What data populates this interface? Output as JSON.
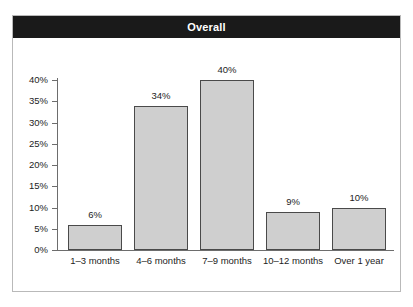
{
  "title": "Overall",
  "colors": {
    "title_band": "#1a1a1a",
    "title_text": "#ffffff",
    "bar_fill": "#cfcfcf",
    "bar_border": "#4a4a4a",
    "axis": "#6d6d6d",
    "frame": "#b9b9b9",
    "background": "#ffffff",
    "text": "#1d1d1d"
  },
  "chart_data": {
    "type": "bar",
    "title": "Overall",
    "xlabel": "",
    "ylabel": "",
    "categories": [
      "1–3 months",
      "4–6 months",
      "7–9 months",
      "10–12 months",
      "Over 1 year"
    ],
    "values": [
      6,
      34,
      40,
      9,
      10
    ],
    "value_labels": [
      "6%",
      "34%",
      "40%",
      "9%",
      "10%"
    ],
    "ylim": [
      0,
      40
    ],
    "ytick_values": [
      0,
      5,
      10,
      15,
      20,
      25,
      30,
      35,
      40
    ],
    "ytick_labels": [
      "0%",
      "5%",
      "10%",
      "15%",
      "20%",
      "25%",
      "30%",
      "35%",
      "40%"
    ],
    "grid": false,
    "legend": null
  }
}
